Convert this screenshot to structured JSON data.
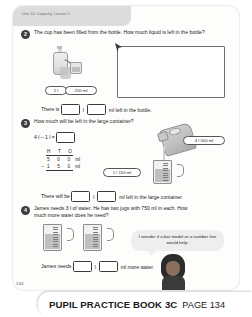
{
  "worksheet": {
    "unit_tab": "Unit 14: Capacity, Lesson 5",
    "page_number": "134"
  },
  "questions": [
    {
      "number": "2",
      "text": "The cup has been filled from the bottle. How much liquid is left in the bottle?",
      "labels": {
        "bottle": "2 l",
        "cup": "250 ml"
      },
      "answer_line": {
        "lead": "There is",
        "unit1": "l",
        "unit2": "ml left in the bottle.",
        "box1_value": "",
        "box2_value": ""
      }
    },
    {
      "number": "3",
      "text": "How much will be left in the large container?",
      "equation": "4 l – 1 l =",
      "equation_box_value": "",
      "column_sum": {
        "headers": "H T O",
        "top": "5 0 0",
        "top_unit": "ml",
        "minus": "–",
        "bottom": "1 5 0",
        "bottom_unit": "ml"
      },
      "labels": {
        "container": "4 l 500 ml",
        "jug": "1 l 150 ml"
      },
      "answer_line": {
        "lead": "There will be",
        "unit1": "l",
        "unit2": "ml left in the large container.",
        "box1_value": "",
        "box2_value": ""
      }
    },
    {
      "number": "4",
      "text": "James needs 3 l of water. He has two jugs with 750 ml in each. How much more water does he need?",
      "speech_bubble": "I wonder if a bar model or a number line would help.",
      "answer_line": {
        "lead": "James needs",
        "unit1": "l",
        "unit2": "ml more water.",
        "box1_value": "",
        "box2_value": ""
      }
    }
  ],
  "footer": {
    "book_title": "PUPIL PRACTICE BOOK 3C",
    "page_label": "PAGE 134"
  },
  "colors": {
    "sheet": "#fdfdfc",
    "tab": "#dcdcdc",
    "ink": "#1c1c1c",
    "bubble": "#eeeeee"
  }
}
